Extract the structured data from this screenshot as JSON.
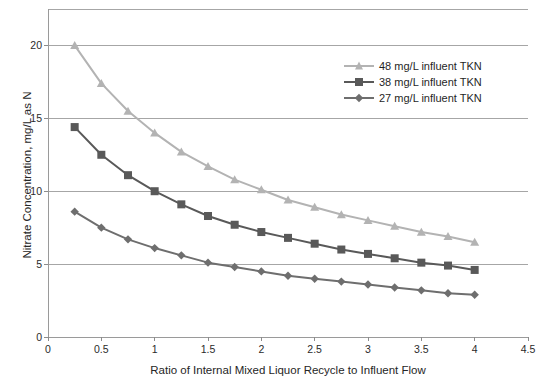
{
  "chart_data": {
    "type": "line",
    "title": "",
    "xlabel": "Ratio of Internal Mixed Liquor Recycle to Influent Flow",
    "ylabel": "Nitrate Concentration, mg/L as N",
    "xlim": [
      0,
      4.5
    ],
    "ylim": [
      0,
      22.5
    ],
    "xticks": [
      "0",
      "0.5",
      "1",
      "1.5",
      "2",
      "2.5",
      "3",
      "3.5",
      "4",
      "4.5"
    ],
    "xtick_values": [
      0,
      0.5,
      1,
      1.5,
      2,
      2.5,
      3,
      3.5,
      4,
      4.5
    ],
    "yticks": [
      "0",
      "5",
      "10",
      "15",
      "20"
    ],
    "ytick_values": [
      0,
      5,
      10,
      15,
      20
    ],
    "grid": "horizontal",
    "legend_position": "upper right",
    "x": [
      0.25,
      0.5,
      0.75,
      1.0,
      1.25,
      1.5,
      1.75,
      2.0,
      2.25,
      2.5,
      2.75,
      3.0,
      3.25,
      3.5,
      3.75,
      4.0
    ],
    "series": [
      {
        "name": "48 mg/L influent TKN",
        "marker": "triangle",
        "color": "#b3b3b3",
        "values": [
          20.0,
          17.4,
          15.5,
          14.0,
          12.7,
          11.7,
          10.8,
          10.1,
          9.4,
          8.9,
          8.4,
          8.0,
          7.6,
          7.2,
          6.9,
          6.5
        ]
      },
      {
        "name": "38 mg/L influent TKN",
        "marker": "square",
        "color": "#595959",
        "values": [
          14.4,
          12.5,
          11.1,
          10.0,
          9.1,
          8.3,
          7.7,
          7.2,
          6.8,
          6.4,
          6.0,
          5.7,
          5.4,
          5.1,
          4.9,
          4.6
        ]
      },
      {
        "name": "27 mg/L influent TKN",
        "marker": "diamond",
        "color": "#6e6e6e",
        "values": [
          8.6,
          7.5,
          6.7,
          6.1,
          5.6,
          5.1,
          4.8,
          4.5,
          4.2,
          4.0,
          3.8,
          3.6,
          3.4,
          3.2,
          3.0,
          2.9
        ]
      }
    ]
  },
  "legend": {
    "items": [
      {
        "label": "48 mg/L influent TKN"
      },
      {
        "label": "38 mg/L influent TKN"
      },
      {
        "label": "27 mg/L influent TKN"
      }
    ]
  },
  "axes": {
    "x_title": "Ratio of Internal Mixed Liquor Recycle to Influent Flow",
    "y_title": "Nitrate Concentration, mg/L as N"
  }
}
